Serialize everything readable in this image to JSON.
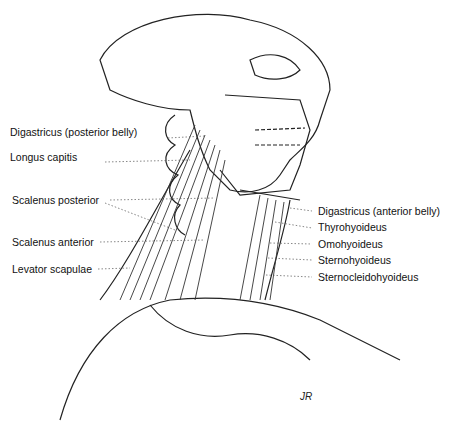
{
  "figure": {
    "signature": "JR"
  },
  "labels_left": [
    {
      "text": "Digastricus (posterior belly)",
      "x": 10,
      "y": 132
    },
    {
      "text": "Longus capitis",
      "x": 10,
      "y": 157
    },
    {
      "text": "Scalenus posterior",
      "x": 12,
      "y": 195
    },
    {
      "text": "Scalenus anterior",
      "x": 12,
      "y": 237
    },
    {
      "text": "Levator scapulae",
      "x": 12,
      "y": 264
    }
  ],
  "labels_right": [
    {
      "text": "Digastricus (anterior belly)",
      "x": 318,
      "y": 206
    },
    {
      "text": "Thyrohyoideus",
      "x": 318,
      "y": 222
    },
    {
      "text": "Omohyoideus",
      "x": 318,
      "y": 239
    },
    {
      "text": "Sternohyoideus",
      "x": 318,
      "y": 255
    },
    {
      "text": "Sternocleidohyoideus",
      "x": 318,
      "y": 272
    }
  ]
}
